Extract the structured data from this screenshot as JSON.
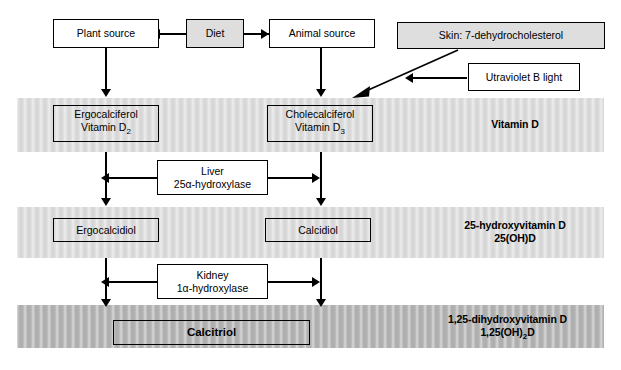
{
  "diagram": {
    "colors": {
      "band_light": "#dcdcdc",
      "band_mid": "#dcdcdc",
      "band_dark": "#b3b3b3",
      "box_shaded": "#dedede",
      "line": "#000000",
      "background": "#ffffff"
    }
  },
  "bands": [
    {
      "id": "vitamin-d",
      "label": "Vitamin D"
    },
    {
      "id": "25-hydroxyvitamin-d",
      "label_line1": "25-hydroxyvitamin D",
      "label_line2": "25(OH)D"
    },
    {
      "id": "1-25-dihydroxyvitamin-d",
      "label_line1": "1,25-dihydroxyvitamin D",
      "label_line2_pre": "1,25(OH)",
      "label_line2_sub": "2",
      "label_line2_post": "D"
    }
  ],
  "boxes": {
    "plant_source": "Plant source",
    "diet": "Diet",
    "animal_source": "Animal source",
    "skin": "Skin: 7-dehydrocholesterol",
    "uvb": "Utraviolet B light",
    "ergocalciferol_line1": "Ergocalciferol",
    "ergocalciferol_line2_pre": "Vitamin D",
    "ergocalciferol_line2_sub": "2",
    "cholecalciferol_line1": "Cholecalciferol",
    "cholecalciferol_line2_pre": "Vitamin D",
    "cholecalciferol_line2_sub": "3",
    "liver_line1": "Liver",
    "liver_line2": "25α-hydroxylase",
    "ergocalcidiol": "Ergocalcidiol",
    "calcidiol": "Calcidiol",
    "kidney_line1": "Kidney",
    "kidney_line2": "1α-hydroxylase",
    "calcitriol": "Calcitriol"
  }
}
